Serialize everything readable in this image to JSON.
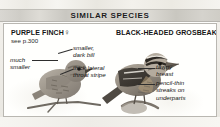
{
  "header": {
    "band_title": "SIMILAR SPECIES",
    "band_bg": "#d4d2cc",
    "band_text_color": "#1b1b1b"
  },
  "panel": {
    "bg": "#fffffd",
    "border_color": "#b9b7b1"
  },
  "species": [
    {
      "name": "PURPLE FINCH",
      "sex_symbol": "♀",
      "page_reference": "see p.300",
      "side": "left",
      "callouts": [
        {
          "id": "much-smaller",
          "text": "much\nsmaller"
        },
        {
          "id": "smaller-dark-bill",
          "text": "smaller,\ndark bill"
        },
        {
          "id": "thick-lateral-throat-stripe",
          "text": "thick lateral\nthroat stripe"
        }
      ]
    },
    {
      "name": "BLACK-HEADED GROSBEAK",
      "sex_symbol": "♀",
      "page_reference": "",
      "side": "right",
      "callouts": [
        {
          "id": "tawny-breast",
          "text": "tawny\nbreast"
        },
        {
          "id": "pencil-thin-streaks",
          "text": "pencil-thin\nstreaks on\nunderparts"
        }
      ]
    }
  ],
  "illustrations": [
    {
      "id": "purple-finch-illustration",
      "alt": "streaked brown female Purple Finch perched on a branch"
    },
    {
      "id": "black-headed-grosbeak-illustration",
      "alt": "female Black-headed Grosbeak with bold head stripes perched on a branch"
    }
  ]
}
